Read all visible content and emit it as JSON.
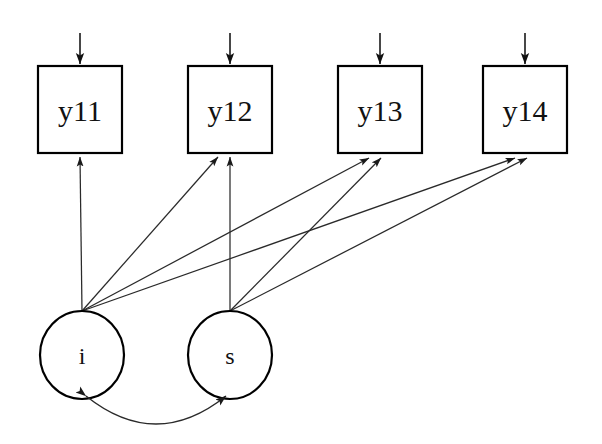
{
  "diagram": {
    "type": "sem-path-diagram",
    "model_name": "Latent Growth Curve Model",
    "background_color": "#ffffff",
    "line_color": "#2a2a2a",
    "node_fill": "#ffffff",
    "node_stroke": "#000000"
  },
  "observed_variables": [
    {
      "id": "y11",
      "label": "y11",
      "shape": "rectangle",
      "x": 38,
      "y": 66,
      "width": 84,
      "height": 87
    },
    {
      "id": "y12",
      "label": "y12",
      "shape": "rectangle",
      "x": 188,
      "y": 66,
      "width": 84,
      "height": 87
    },
    {
      "id": "y13",
      "label": "y13",
      "shape": "rectangle",
      "x": 338,
      "y": 66,
      "width": 84,
      "height": 87
    },
    {
      "id": "y14",
      "label": "y14",
      "shape": "rectangle",
      "x": 483,
      "y": 66,
      "width": 84,
      "height": 87
    }
  ],
  "latent_variables": [
    {
      "id": "i",
      "label": "i",
      "shape": "ellipse",
      "cx": 82,
      "cy": 355,
      "rx": 42,
      "ry": 44
    },
    {
      "id": "s",
      "label": "s",
      "shape": "ellipse",
      "cx": 230,
      "cy": 355,
      "rx": 42,
      "ry": 44
    }
  ],
  "residual_arrows": [
    {
      "target": "y11",
      "x": 80,
      "y_start": 33,
      "y_end": 66
    },
    {
      "target": "y12",
      "x": 230,
      "y_start": 33,
      "y_end": 66
    },
    {
      "target": "y13",
      "x": 380,
      "y_start": 33,
      "y_end": 66
    },
    {
      "target": "y14",
      "x": 525,
      "y_start": 33,
      "y_end": 66
    }
  ],
  "loadings": [
    {
      "from": "i",
      "to": "y11",
      "x1": 82,
      "y1": 311,
      "x2": 80,
      "y2": 153
    },
    {
      "from": "i",
      "to": "y12",
      "x1": 82,
      "y1": 311,
      "x2": 220,
      "y2": 153
    },
    {
      "from": "i",
      "to": "y13",
      "x1": 82,
      "y1": 311,
      "x2": 370,
      "y2": 153
    },
    {
      "from": "i",
      "to": "y14",
      "x1": 82,
      "y1": 311,
      "x2": 516,
      "y2": 153
    },
    {
      "from": "s",
      "to": "y12",
      "x1": 230,
      "y1": 311,
      "x2": 231,
      "y2": 153
    },
    {
      "from": "s",
      "to": "y13",
      "x1": 230,
      "y1": 311,
      "x2": 382,
      "y2": 153
    },
    {
      "from": "s",
      "to": "y14",
      "x1": 230,
      "y1": 311,
      "x2": 528,
      "y2": 153
    }
  ],
  "covariance": {
    "between": [
      "i",
      "s"
    ],
    "double_headed": true,
    "start_x": 82,
    "start_y": 397,
    "end_x": 230,
    "end_y": 397,
    "control_x": 156,
    "control_y": 452
  }
}
